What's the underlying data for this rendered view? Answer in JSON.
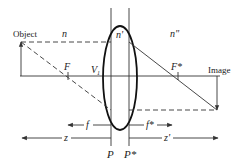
{
  "figure": {
    "type": "thick-lens-imaging-diagram",
    "labels": {
      "object": "Object",
      "image": "Image",
      "n_left": "n",
      "n_lens": "n'",
      "n_right": "n\"",
      "focal_front": "F",
      "focal_back": "F*",
      "vertex": "V",
      "vertex_sub": "1",
      "principal_front": "P",
      "principal_back": "P*",
      "focal_length_front": "f",
      "focal_length_back": "f*",
      "object_distance": "z",
      "image_distance": "z'"
    },
    "colors": {
      "stroke": "#333333",
      "lens": "#111111",
      "text": "#222222",
      "background": "#ffffff"
    }
  }
}
